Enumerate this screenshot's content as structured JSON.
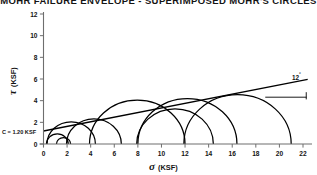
{
  "title": "MOHR FAILURE ENVELOPE - SUPERIMPOSED MOHR'S CIRCLES",
  "axes": {
    "x": {
      "symbol": "σ",
      "unit": "(KSF)",
      "label": "σ (KSF)",
      "min": 0,
      "max": 22,
      "ticks": [
        0,
        2,
        4,
        6,
        8,
        10,
        12,
        14,
        16,
        18,
        20,
        22
      ],
      "tick_labels": [
        "0",
        "2",
        "4",
        "6",
        "8",
        "10",
        "12",
        "14",
        "16",
        "18",
        "20",
        "22"
      ]
    },
    "y": {
      "symbol": "τ",
      "unit": "(KSF)",
      "label": "τ (KSF)",
      "min": 0,
      "max": 12,
      "ticks": [
        0,
        2,
        4,
        6,
        8,
        10,
        12
      ],
      "tick_labels": [
        "0",
        "2",
        "4",
        "6",
        "8",
        "10",
        "12"
      ]
    }
  },
  "annotations": {
    "cohesion": "C = 1.20 KSF",
    "friction_angle_value": "12",
    "friction_angle_degree_symbol": "°",
    "friction_angle_label": "12°"
  },
  "colors": {
    "curve": "#000000",
    "envelope": "#000000",
    "axis": "#6e6e6e",
    "text": "#141414",
    "background": "#ffffff"
  },
  "chart_data": {
    "type": "line",
    "title": "MOHR FAILURE ENVELOPE - SUPERIMPOSED MOHR'S CIRCLES",
    "xlabel": "σ (KSF)",
    "ylabel": "τ (KSF)",
    "xlim": [
      0,
      22
    ],
    "ylim": [
      0,
      12
    ],
    "grid": false,
    "legend": null,
    "cohesion_c_ksf": 1.2,
    "friction_angle_deg": 12,
    "envelope": {
      "name": "Mohr failure envelope",
      "intercept_ksf": 1.2,
      "slope": 0.2126,
      "x": [
        0,
        22.4
      ],
      "y": [
        1.2,
        5.96
      ]
    },
    "mohr_circles": [
      {
        "sigma3": 0.25,
        "sigma1": 2.1,
        "center": 1.175,
        "radius": 0.925
      },
      {
        "sigma3": 1.1,
        "sigma1": 2.3,
        "center": 1.7,
        "radius": 0.6
      },
      {
        "sigma3": 0.3,
        "sigma1": 4.4,
        "center": 2.35,
        "radius": 2.05
      },
      {
        "sigma3": 1.95,
        "sigma1": 6.6,
        "center": 4.275,
        "radius": 2.325
      },
      {
        "sigma3": 3.9,
        "sigma1": 12.0,
        "center": 7.95,
        "radius": 4.05
      },
      {
        "sigma3": 7.9,
        "sigma1": 14.4,
        "center": 11.15,
        "radius": 3.25
      },
      {
        "sigma3": 8.0,
        "sigma1": 16.4,
        "center": 12.2,
        "radius": 4.2
      },
      {
        "sigma3": 11.9,
        "sigma1": 21.0,
        "center": 16.45,
        "radius": 4.55
      }
    ]
  }
}
